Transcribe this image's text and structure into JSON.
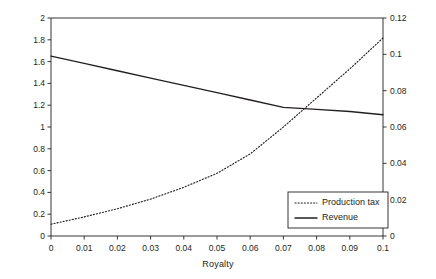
{
  "chart_data": {
    "type": "line",
    "title": "",
    "xlabel": "Royalty",
    "ylabel": "Dollars",
    "y2label": "",
    "xlim": [
      0,
      0.1
    ],
    "ylim": [
      0,
      2
    ],
    "y2lim": [
      0,
      0.12
    ],
    "grid": false,
    "legend_position": "bottom-right",
    "xticks": [
      "0",
      "0.01",
      "0.02",
      "0.03",
      "0.04",
      "0.05",
      "0.06",
      "0.07",
      "0.08",
      "0.09",
      "0.1"
    ],
    "xtick_values": [
      0,
      0.01,
      0.02,
      0.03,
      0.04,
      0.05,
      0.06,
      0.07,
      0.08,
      0.09,
      0.1
    ],
    "yticks": [
      "0",
      "0.2",
      "0.4",
      "0.6",
      "0.8",
      "1",
      "1.2",
      "1.4",
      "1.6",
      "1.8",
      "2"
    ],
    "ytick_values": [
      0,
      0.2,
      0.4,
      0.6,
      0.8,
      1,
      1.2,
      1.4,
      1.6,
      1.8,
      2
    ],
    "y2ticks": [
      "0",
      "0.02",
      "0.04",
      "0.06",
      "0.08",
      "0.1",
      "0.12"
    ],
    "y2tick_values": [
      0,
      0.02,
      0.04,
      0.06,
      0.08,
      0.1,
      0.12
    ],
    "x": [
      0,
      0.01,
      0.02,
      0.03,
      0.04,
      0.05,
      0.06,
      0.07,
      0.08,
      0.09,
      0.1
    ],
    "series": [
      {
        "name": "Production tax",
        "axis": "right",
        "style": "dotted",
        "color": "#231f20",
        "values": [
          0.0065,
          0.0105,
          0.015,
          0.0203,
          0.0268,
          0.0345,
          0.0452,
          0.06,
          0.076,
          0.092,
          0.109
        ]
      },
      {
        "name": "Revenue",
        "axis": "left",
        "style": "solid",
        "color": "#231f20",
        "values": [
          1.65,
          1.583,
          1.516,
          1.449,
          1.382,
          1.315,
          1.248,
          1.18,
          1.162,
          1.142,
          1.112
        ]
      }
    ],
    "legend": [
      {
        "label": "Production tax",
        "style": "dotted"
      },
      {
        "label": "Revenue",
        "style": "solid"
      }
    ]
  }
}
